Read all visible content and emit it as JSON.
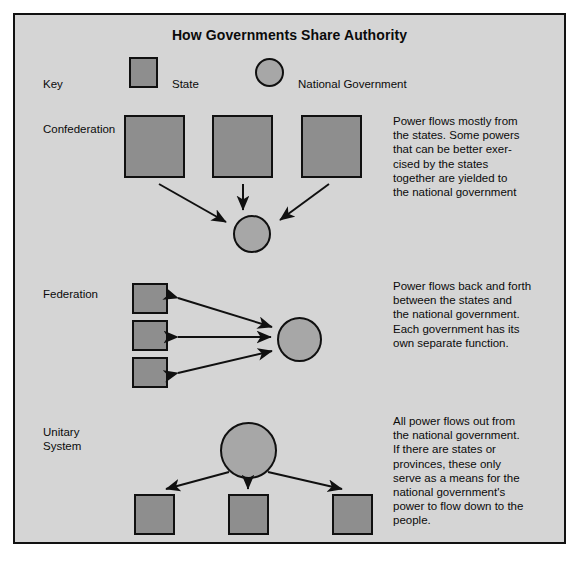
{
  "title": "How Governments Share Authority",
  "key": {
    "label": "Key",
    "state_label": "State",
    "national_label": "National Government"
  },
  "colors": {
    "background": "#d5d5d5",
    "state_fill": "#8e8e8e",
    "national_fill": "#a7a7a7",
    "outline": "#101010",
    "text": "#0b0b0b"
  },
  "sections": [
    {
      "id": "confederation",
      "label": "Confederation",
      "description": "Power flows mostly from\nthe states. Some powers\nthat can be better exer-\ncised by the states\ntogether are yielded to\nthe national government",
      "state_count": 3,
      "national_count": 1,
      "flow": "states-to-national"
    },
    {
      "id": "federation",
      "label": "Federation",
      "description": "Power flows back and forth\nbetween the states and\nthe national government.\nEach government has its\nown separate function.",
      "state_count": 3,
      "national_count": 1,
      "flow": "bidirectional"
    },
    {
      "id": "unitary-system",
      "label": "Unitary\nSystem",
      "description": "All power flows out from\nthe national government.\nIf there are states or\nprovinces, these only\nserve as a means for the\nnational government's\npower to flow down to the\npeople.",
      "state_count": 3,
      "national_count": 1,
      "flow": "national-to-states"
    }
  ]
}
